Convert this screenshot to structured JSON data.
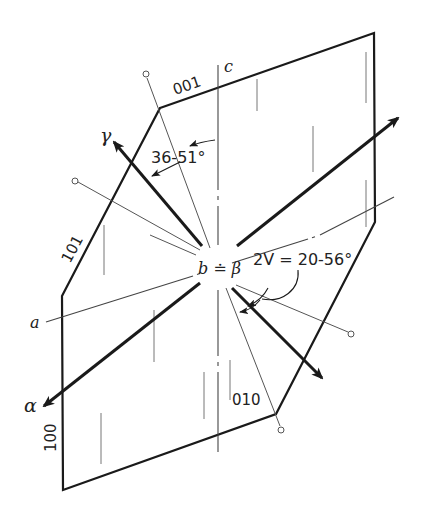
{
  "figure": {
    "type": "optical orientation diagram (monoclinic crystal section)",
    "cut_off_top_text": ""
  },
  "crystal_faces": {
    "face_001": "001",
    "face_101": "101",
    "face_100": "100",
    "face_010": "010"
  },
  "axes": {
    "a": "a",
    "c": "c",
    "b_equals_beta": "b ≐ β"
  },
  "indicatrix": {
    "alpha": "α",
    "gamma": "γ"
  },
  "angles": {
    "gamma_to_c": "36-51°",
    "two_v": "2V = 20-56°"
  },
  "colors": {
    "line": "#1a1a1a",
    "thin_line": "#555555",
    "background": "#ffffff"
  }
}
